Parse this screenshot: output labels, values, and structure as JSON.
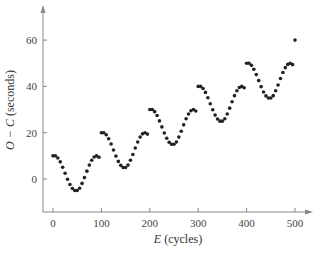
{
  "chart_data": {
    "type": "scatter",
    "title": "",
    "xlabel_var": "E",
    "xlabel_unit": "(cycles)",
    "ylabel_var": "O − C",
    "ylabel_unit": "(seconds)",
    "xlim": [
      -5,
      520
    ],
    "ylim": [
      -13,
      72
    ],
    "xticks": [
      0,
      100,
      200,
      300,
      400,
      500
    ],
    "yticks": [
      0,
      20,
      40,
      60
    ],
    "grid": false,
    "legend": null,
    "model": "O−C ≈ 0.1·E + 10·cos(2πE/100)",
    "x": [
      0,
      5,
      10,
      15,
      20,
      25,
      30,
      35,
      40,
      45,
      50,
      55,
      60,
      65,
      70,
      75,
      80,
      85,
      90,
      95,
      100,
      105,
      110,
      115,
      120,
      125,
      130,
      135,
      140,
      145,
      150,
      155,
      160,
      165,
      170,
      175,
      180,
      185,
      190,
      195,
      200,
      205,
      210,
      215,
      220,
      225,
      230,
      235,
      240,
      245,
      250,
      255,
      260,
      265,
      270,
      275,
      280,
      285,
      290,
      295,
      300,
      305,
      310,
      315,
      320,
      325,
      330,
      335,
      340,
      345,
      350,
      355,
      360,
      365,
      370,
      375,
      380,
      385,
      390,
      395,
      400,
      405,
      410,
      415,
      420,
      425,
      430,
      435,
      440,
      445,
      450,
      455,
      460,
      465,
      470,
      475,
      480,
      485,
      490,
      495,
      500
    ],
    "series": [
      {
        "name": "O − C",
        "values": [
          10.0,
          10.0,
          9.1,
          7.4,
          5.1,
          2.5,
          -0.1,
          -2.4,
          -4.1,
          -5.0,
          -5.0,
          -4.0,
          -1.9,
          0.6,
          3.4,
          6.0,
          8.1,
          9.5,
          10.0,
          9.4,
          20.0,
          20.0,
          19.1,
          17.4,
          15.1,
          12.5,
          9.9,
          7.6,
          5.9,
          5.0,
          5.0,
          6.0,
          8.1,
          10.6,
          13.4,
          16.0,
          18.1,
          19.5,
          20.0,
          19.4,
          30.0,
          30.0,
          29.1,
          27.4,
          25.1,
          22.5,
          19.9,
          17.6,
          15.9,
          15.0,
          15.0,
          16.0,
          18.1,
          20.6,
          23.4,
          26.0,
          28.1,
          29.5,
          30.0,
          29.4,
          40.0,
          40.0,
          39.1,
          37.4,
          35.1,
          32.5,
          29.9,
          27.6,
          25.9,
          25.0,
          25.0,
          26.0,
          28.1,
          30.6,
          33.4,
          36.0,
          38.1,
          39.5,
          40.0,
          39.4,
          50.0,
          50.0,
          49.1,
          47.4,
          45.1,
          42.5,
          39.9,
          37.6,
          35.9,
          35.0,
          35.0,
          36.0,
          38.1,
          40.6,
          43.4,
          46.0,
          48.1,
          49.5,
          50.0,
          49.4,
          60.0
        ]
      }
    ],
    "marker": {
      "shape": "circle",
      "color": "#222222",
      "radius": 1.8
    },
    "colors": {
      "axis": "#888888",
      "text": "#444444",
      "points": "#222222"
    }
  }
}
